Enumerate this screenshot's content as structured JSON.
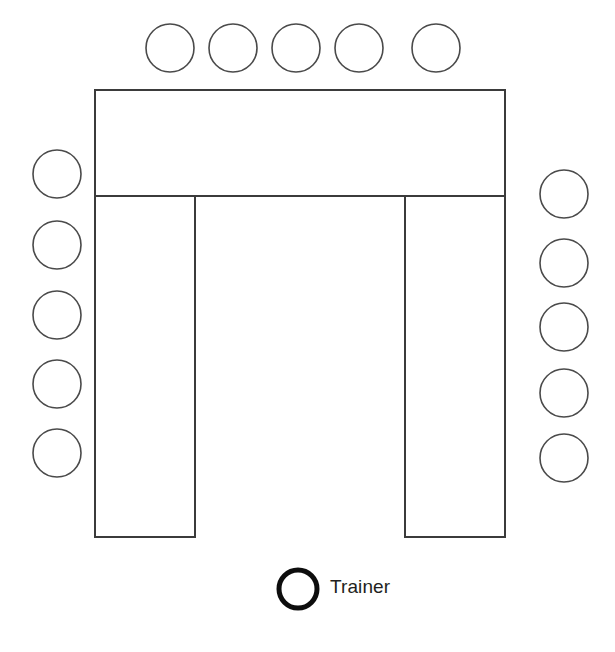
{
  "diagram": {
    "background_color": "#ffffff",
    "line_color": "#3b3b3b",
    "trainer_marker_color": "#0d0d0d",
    "table": {
      "name": "u-shaped-table",
      "fill": "#ffffff",
      "stroke": "#3b3b3b",
      "stroke_width": 2,
      "outline_points": "95,90 505,90 505,537 405,537 405,196 195,196 195,537 95,537",
      "inner_divider": "95,196 505,196",
      "top_section": {
        "x": 95,
        "y": 90,
        "width": 410,
        "height": 106
      },
      "left_leg": {
        "x": 95,
        "y": 196,
        "width": 100,
        "height": 341
      },
      "right_leg": {
        "x": 405,
        "y": 196,
        "width": 100,
        "height": 341
      }
    },
    "seats": {
      "radius": 24,
      "stroke": "#4a4a4a",
      "stroke_width": 1.6,
      "fill": "#ffffff",
      "top_row": {
        "name": "seat-row-top",
        "count": 5,
        "centers": [
          {
            "cx": 170,
            "cy": 48
          },
          {
            "cx": 233,
            "cy": 48
          },
          {
            "cx": 296,
            "cy": 48
          },
          {
            "cx": 359,
            "cy": 48
          },
          {
            "cx": 436,
            "cy": 48
          }
        ]
      },
      "left_column": {
        "name": "seat-column-left",
        "count": 5,
        "centers": [
          {
            "cx": 57,
            "cy": 174
          },
          {
            "cx": 57,
            "cy": 245
          },
          {
            "cx": 57,
            "cy": 315
          },
          {
            "cx": 57,
            "cy": 384
          },
          {
            "cx": 57,
            "cy": 453
          }
        ]
      },
      "right_column": {
        "name": "seat-column-right",
        "count": 5,
        "centers": [
          {
            "cx": 564,
            "cy": 194
          },
          {
            "cx": 564,
            "cy": 263
          },
          {
            "cx": 564,
            "cy": 327
          },
          {
            "cx": 564,
            "cy": 393
          },
          {
            "cx": 564,
            "cy": 458
          }
        ]
      },
      "total_seats": 15
    },
    "legend": {
      "trainer": {
        "label": "Trainer",
        "marker": "thick-circle-icon",
        "marker_center": {
          "cx": 298,
          "cy": 589
        },
        "marker_radius": 19,
        "marker_stroke_width": 5
      }
    }
  }
}
